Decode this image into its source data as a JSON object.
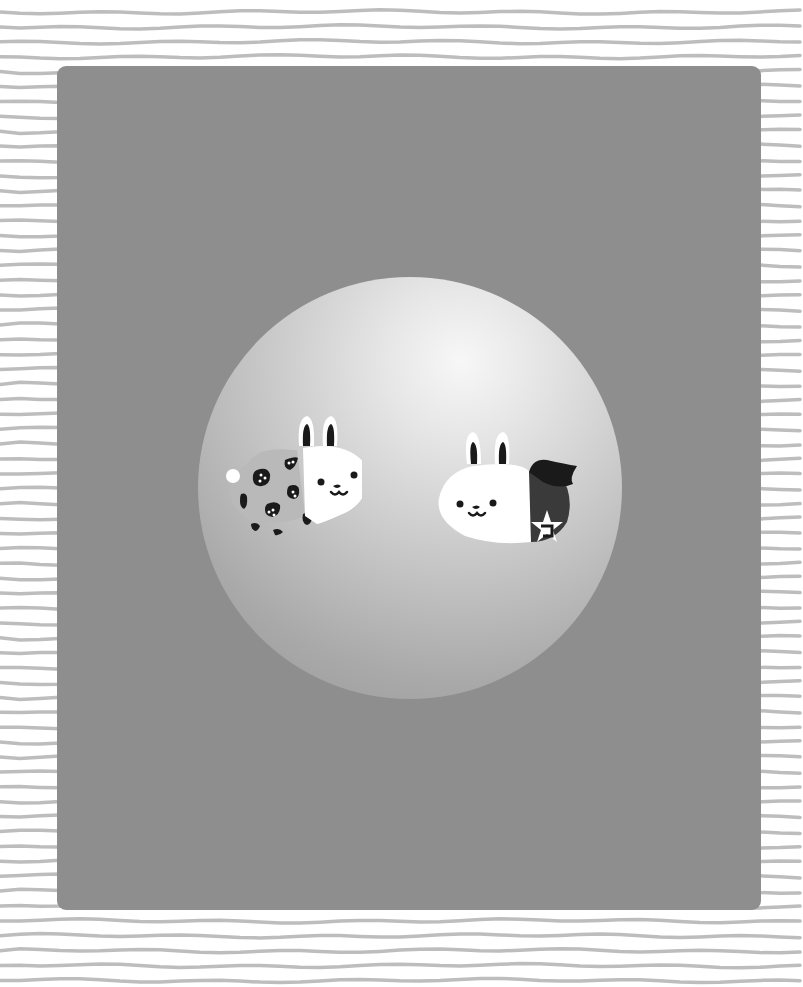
{
  "scene": {
    "description": "Two cartoon bunnies on a glowing sphere over a gray panel on lined paper",
    "colors": {
      "paper": "#ffffff",
      "paper_lines": "#bdbdbd",
      "panel": "#8e8e8e",
      "sphere_highlight": "#f7f7f7",
      "sphere_shadow": "#979797",
      "bunny_white": "#ffffff",
      "bunny_dark": "#1a1a1a",
      "costume_dark": "#3a3a3a"
    },
    "characters": [
      {
        "name": "strawberry-costume-bunny",
        "costume": "strawberry",
        "position": "left"
      },
      {
        "name": "caped-star-bunny",
        "costume": "cape with star badge",
        "position": "right"
      }
    ],
    "paper_line_count": 66
  }
}
